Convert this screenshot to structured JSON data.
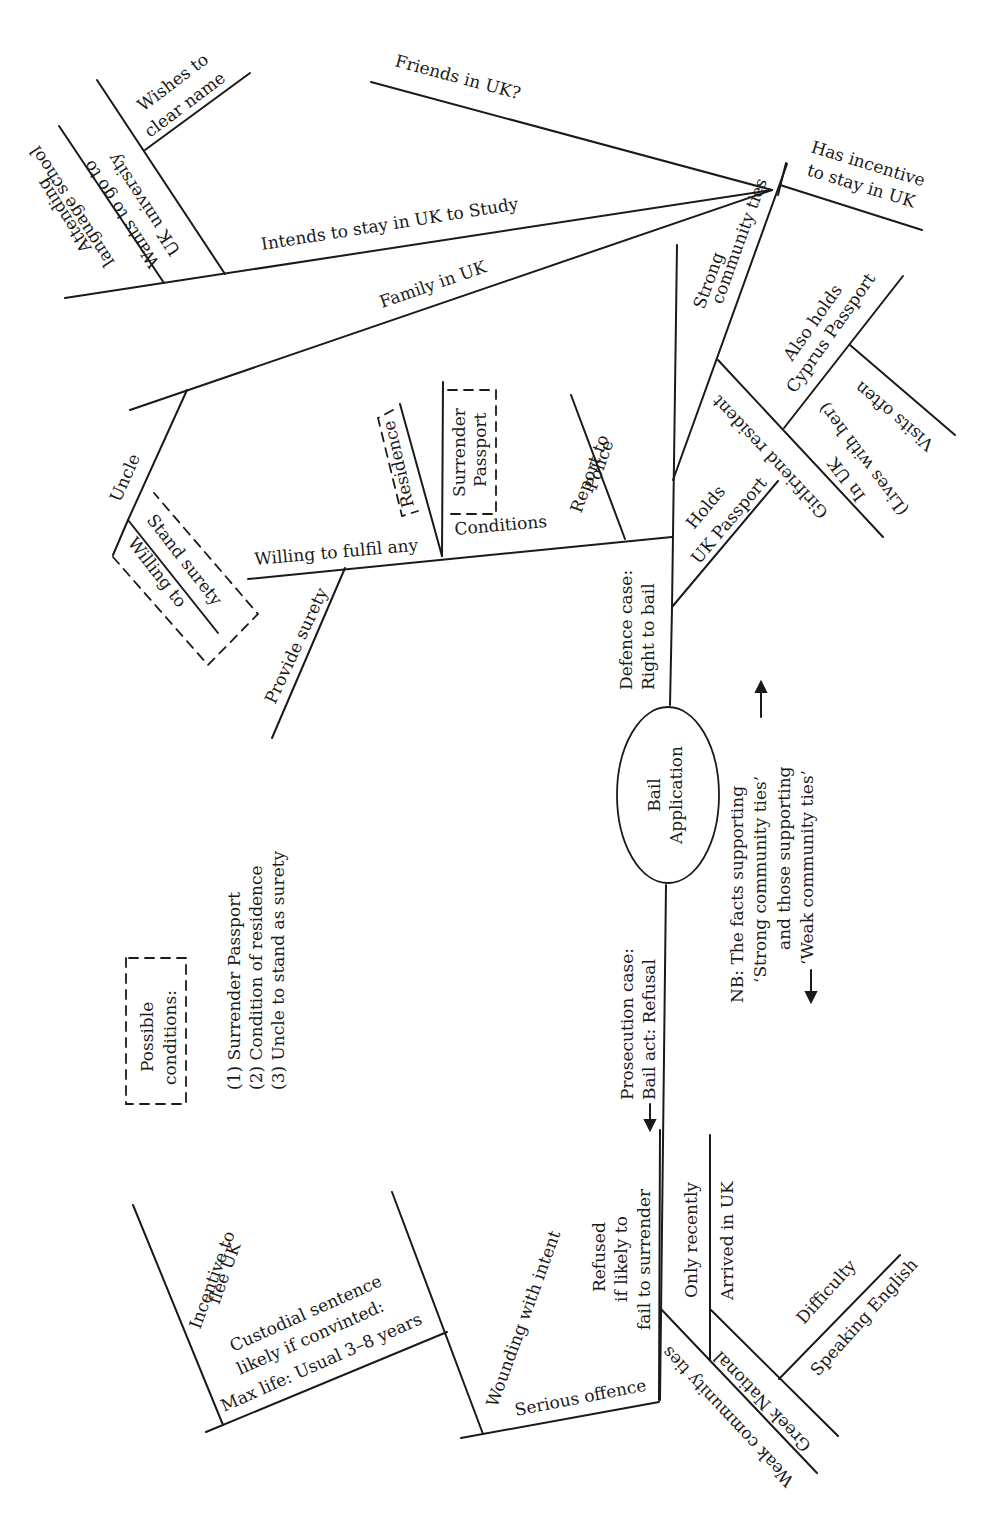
{
  "center": {
    "line1": "Bail",
    "line2": "Application"
  },
  "defence": {
    "heading1": "Defence case:",
    "heading2": "Right to bail",
    "has_incentive": [
      "Has incentive",
      "to stay in UK"
    ],
    "friends": "Friends in UK?",
    "intends_study": "Intends to stay in UK to Study",
    "wishes_clear": [
      "Wishes to",
      "clear name"
    ],
    "wants_uni": [
      "Wants to go to",
      "UK university"
    ],
    "language_school": [
      "Attending",
      "language school"
    ],
    "family": "Family in UK",
    "uncle": "Uncle",
    "stand_surety": [
      "Willing to",
      "Stand surety"
    ],
    "willing_fulfil": "Willing to fulfil any",
    "conditions": "Conditions",
    "residence": "Residence",
    "surrender_passport": [
      "Surrender",
      "Passport"
    ],
    "report_police": [
      "Report to",
      "Police"
    ],
    "provide_surety": "Provide surety",
    "strong_ties": [
      "Strong",
      "community ties"
    ],
    "holds_uk_passport": [
      "Holds",
      "UK Passport"
    ],
    "girlfriend": "Girlfriend resident",
    "in_uk": [
      "In UK",
      "(Lives with her)"
    ],
    "cyprus_passport": [
      "Also holds",
      "Cyprus Passport"
    ],
    "visits_often": "Visits often"
  },
  "prosecution": {
    "heading1": "Prosecution case:",
    "heading2": "Bail act: Refusal",
    "arrow": "←",
    "refused": [
      "Refused",
      "if likely to",
      "fail to surrender"
    ],
    "serious_offence": "Serious offence",
    "wounding": "Wounding with intent",
    "custodial": [
      "Custodial sentence",
      "likely if convinted:",
      "Max life: Usual 3–8 years"
    ],
    "incentive_flee": [
      "Incentive to",
      "flee UK"
    ],
    "weak_ties": "Weak community ties",
    "greek": "Greek National",
    "only_recently": "Only recently",
    "arrived": "Arrived in UK",
    "difficulty": "Difficulty",
    "speaking_english": "Speaking English"
  },
  "note": {
    "line1": "NB: The facts supporting",
    "line2": "‘Strong community ties’",
    "line3": "and those supporting",
    "line4": "‘Weak community ties’",
    "arrow_up": "→",
    "arrow_down": "←"
  },
  "possible_conditions": {
    "heading1": "Possible",
    "heading2": "conditions:",
    "items": [
      "(1) Surrender Passport",
      "(2) Condition of residence",
      "(3) Uncle to stand as surety"
    ]
  }
}
